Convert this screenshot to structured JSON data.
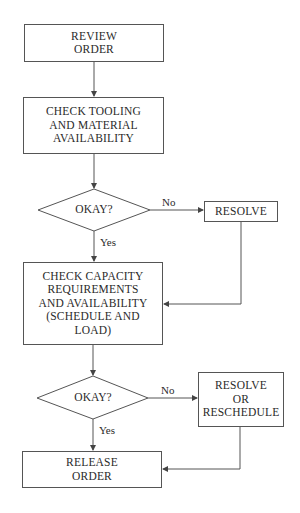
{
  "flowchart": {
    "nodes": {
      "review_order": "REVIEW\nORDER",
      "check_tooling": "CHECK TOOLING\nAND MATERIAL\nAVAILABILITY",
      "decision1": "OKAY?",
      "resolve": "RESOLVE",
      "check_capacity": "CHECK CAPACITY\nREQUIREMENTS\nAND AVAILABILITY\n(SCHEDULE AND\nLOAD)",
      "decision2": "OKAY?",
      "resolve_reschedule": "RESOLVE\nOR\nRESCHEDULE",
      "release_order": "RELEASE\nORDER"
    },
    "edge_labels": {
      "d1_no": "No",
      "d1_yes": "Yes",
      "d2_no": "No",
      "d2_yes": "Yes"
    },
    "colors": {
      "line": "#555555",
      "text": "#2a2a2a",
      "background": "#ffffff"
    }
  }
}
